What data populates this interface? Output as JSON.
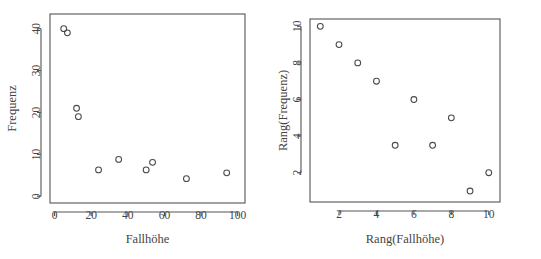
{
  "figure": {
    "name": "scatterplot-pair-fallhoehe-frequenz",
    "background": "#ffffff",
    "foreground": "#4a4a4a",
    "panel_count": 2
  },
  "chart_data": [
    {
      "type": "scatter",
      "id": "left",
      "title": "",
      "xlabel": "Fallhöhe",
      "ylabel": "Frequenz",
      "xlim": [
        -2.5,
        104
      ],
      "ylim": [
        -1.6,
        43.5
      ],
      "xticks": [
        0,
        20,
        40,
        60,
        80,
        100
      ],
      "xticklabels": [
        "0",
        "20",
        "40",
        "60",
        "80",
        "100"
      ],
      "yticks": [
        0,
        10,
        20,
        30,
        40
      ],
      "yticklabels": [
        "0",
        "10",
        "20",
        "30",
        "40"
      ],
      "grid": false,
      "legend": "none",
      "marker": "open-circle",
      "x": [
        5,
        7,
        12,
        13,
        24,
        35,
        50,
        53.5,
        72,
        94
      ],
      "y": [
        40,
        39,
        21,
        19,
        6.3,
        8.8,
        6.3,
        8.1,
        4.2,
        5.6
      ]
    },
    {
      "type": "scatter",
      "id": "right",
      "title": "",
      "xlabel": "Rang(Fallhöhe)",
      "ylabel": "Rang(Frequenz)",
      "xlim": [
        0.45,
        10.6
      ],
      "ylim": [
        0.4,
        10.4
      ],
      "xticks": [
        2,
        4,
        6,
        8,
        10
      ],
      "xticklabels": [
        "2",
        "4",
        "6",
        "8",
        "10"
      ],
      "yticks": [
        2,
        4,
        6,
        8,
        10
      ],
      "yticklabels": [
        "2",
        "4",
        "6",
        "8",
        "10"
      ],
      "grid": false,
      "legend": "none",
      "marker": "open-circle",
      "x": [
        1,
        2,
        3,
        4,
        5,
        6,
        7,
        8,
        9,
        10
      ],
      "y": [
        10,
        9,
        8,
        7,
        3.5,
        6,
        3.5,
        5,
        1,
        2
      ]
    }
  ]
}
